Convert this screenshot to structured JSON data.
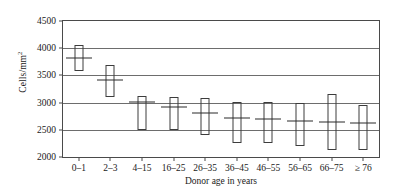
{
  "chart_data": {
    "type": "box",
    "title": "",
    "xlabel": "Donor age in years",
    "ylabel": "Cells/mm",
    "ylabel_superscript": "2",
    "categories": [
      "0–1",
      "2–3",
      "4–15",
      "16–25",
      "26–35",
      "36–45",
      "46–55",
      "56–65",
      "66–75",
      "≥ 76"
    ],
    "ylim": [
      2000,
      4500
    ],
    "yticks": [
      2000,
      2500,
      3000,
      3500,
      4000,
      4500
    ],
    "ytick_labels": [
      "2000",
      "2500",
      "3000",
      "3500",
      "4000",
      "4500"
    ],
    "grid": "horizontal",
    "legend": "none",
    "series": [
      {
        "name": "Endothelial cell density",
        "boxes": [
          {
            "category": "0–1",
            "low": 3580,
            "high": 4060,
            "median": 3820
          },
          {
            "category": "2–3",
            "low": 3100,
            "high": 3700,
            "median": 3420
          },
          {
            "category": "4–15",
            "low": 2500,
            "high": 3120,
            "median": 3020
          },
          {
            "category": "16–25",
            "low": 2500,
            "high": 3100,
            "median": 2920
          },
          {
            "category": "26–35",
            "low": 2400,
            "high": 3080,
            "median": 2800
          },
          {
            "category": "36–45",
            "low": 2250,
            "high": 3010,
            "median": 2720
          },
          {
            "category": "46–55",
            "low": 2250,
            "high": 3020,
            "median": 2700
          },
          {
            "category": "56–65",
            "low": 2200,
            "high": 3000,
            "median": 2660
          },
          {
            "category": "66–75",
            "low": 2130,
            "high": 3150,
            "median": 2650
          },
          {
            "category": "≥ 76",
            "low": 2130,
            "high": 2950,
            "median": 2620
          }
        ]
      }
    ]
  }
}
